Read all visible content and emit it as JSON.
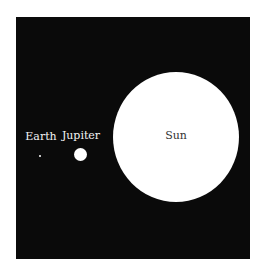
{
  "diagram": {
    "title": "",
    "background": "#0a0a0a",
    "bodies": [
      {
        "name": "Earth",
        "label": "Earth",
        "color": "#ffffff"
      },
      {
        "name": "Jupiter",
        "label": "Jupiter",
        "color": "#ffffff"
      },
      {
        "name": "Sun",
        "label": "Sun",
        "color": "#ffffff"
      }
    ]
  }
}
